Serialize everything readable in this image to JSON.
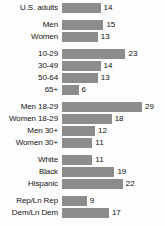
{
  "chart_data": {
    "type": "bar",
    "title": "",
    "subtitle": "",
    "xlabel": "",
    "ylabel": "",
    "orientation": "horizontal",
    "grid": false,
    "legend": false,
    "xlim": [
      0,
      29
    ],
    "value_suffix": "",
    "categories": [
      "U.S. adults",
      "Men",
      "Women",
      "10-29",
      "30-49",
      "50-64",
      "65+",
      "Men 18-29",
      "Women 18-29",
      "Men 30+",
      "Women 30+",
      "White",
      "Black",
      "Hispanic",
      "Rep/Ln Rep",
      "Dem/Ln Dem"
    ],
    "values": [
      14,
      15,
      13,
      23,
      14,
      13,
      6,
      29,
      18,
      12,
      11,
      11,
      19,
      22,
      9,
      17
    ],
    "groups": [
      {
        "name": "total",
        "rows": [
          {
            "label": "U.S. adults",
            "value": 14
          }
        ]
      },
      {
        "name": "gender",
        "rows": [
          {
            "label": "Men",
            "value": 15
          },
          {
            "label": "Women",
            "value": 13
          }
        ]
      },
      {
        "name": "age",
        "rows": [
          {
            "label": "10-29",
            "value": 23
          },
          {
            "label": "30-49",
            "value": 14
          },
          {
            "label": "50-64",
            "value": 13
          },
          {
            "label": "65+",
            "value": 6
          }
        ]
      },
      {
        "name": "gender-by-age",
        "rows": [
          {
            "label": "Men 18-29",
            "value": 29
          },
          {
            "label": "Women 18-29",
            "value": 18
          },
          {
            "label": "Men 30+",
            "value": 12
          },
          {
            "label": "Women 30+",
            "value": 11
          }
        ]
      },
      {
        "name": "race-ethnicity",
        "rows": [
          {
            "label": "White",
            "value": 11
          },
          {
            "label": "Black",
            "value": 19
          },
          {
            "label": "Hispanic",
            "value": 22
          }
        ]
      },
      {
        "name": "party",
        "rows": [
          {
            "label": "Rep/Ln Rep",
            "value": 9
          },
          {
            "label": "Dem/Ln Dem",
            "value": 17
          }
        ]
      }
    ]
  },
  "style": {
    "bar_color": "#8c8c8c",
    "text_color": "#141414",
    "background": "#fdfdfd"
  }
}
